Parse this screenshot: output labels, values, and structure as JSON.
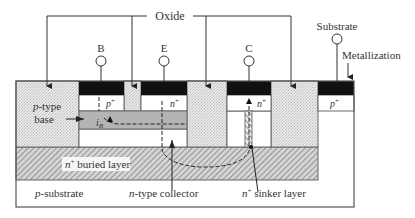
{
  "labels": {
    "oxide": "Oxide",
    "substrate_terminal": "Substrate",
    "metallization": "Metallization",
    "base_terminal": "B",
    "emitter_terminal": "E",
    "collector_terminal": "C",
    "p_type_base_italic": "p",
    "p_type_base_rest": "-type",
    "base": "base",
    "buried_layer_italic": "n",
    "buried_layer_sup": "+",
    "buried_layer_rest": " buried layer",
    "p_substrate_italic": "p",
    "p_substrate_rest": "-substrate",
    "n_collector_italic": "n",
    "n_collector_rest": "-type collector",
    "sinker_italic": "n",
    "sinker_sup": "+",
    "sinker_rest": " sinker layer",
    "p_plus_base_italic": "p",
    "p_plus_sup": "+",
    "n_plus_emitter_italic": "n",
    "n_plus_sup": "+",
    "n_plus_collector_italic": "n",
    "p_plus_substrate_italic": "p",
    "ib_italic": "i",
    "ib_sub": "B"
  },
  "colors": {
    "outline": "#555555",
    "metal": "#111111",
    "oxide_fill": "#e6e6e6",
    "base_region": "#b4b4b4",
    "buried_hatch": "#8a8a8a",
    "text": "#333333"
  }
}
